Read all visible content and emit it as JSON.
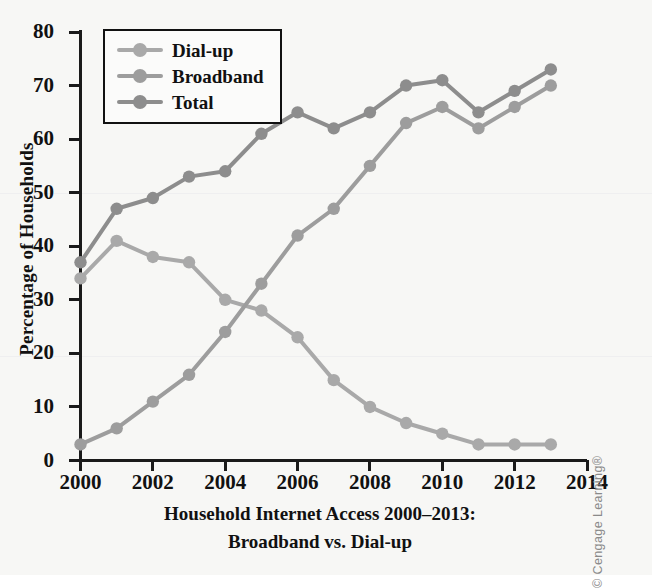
{
  "figure": {
    "background_color": "#f7f7f5",
    "caption_line1": "Household Internet Access 2000–2013:",
    "caption_line2": "Broadband vs. Dial-up",
    "credit": "© Cengage Learning®"
  },
  "legend": {
    "position": "top-left-inside",
    "entries": [
      {
        "label": "Dial-up",
        "color": "#a9a9a9"
      },
      {
        "label": "Broadband",
        "color": "#9d9d9d"
      },
      {
        "label": "Total",
        "color": "#8d8d8d"
      }
    ]
  },
  "axes": {
    "y_title": "Percentage of Households",
    "y_ticks": [
      "0",
      "10",
      "20",
      "30",
      "40",
      "50",
      "60",
      "70",
      "80"
    ],
    "x_ticks": [
      "2000",
      "2002",
      "2004",
      "2006",
      "2008",
      "2010",
      "2012",
      "2014"
    ]
  },
  "chart_data": {
    "type": "line",
    "title": "Household Internet Access 2000–2013: Broadband vs. Dial-up",
    "xlabel": "",
    "ylabel": "Percentage of Households",
    "xlim": [
      2000,
      2014
    ],
    "ylim": [
      0,
      80
    ],
    "ytick_step": 10,
    "xtick_step": 2,
    "grid": false,
    "legend_position": "upper left",
    "x": [
      2000,
      2001,
      2002,
      2003,
      2004,
      2005,
      2006,
      2007,
      2008,
      2009,
      2010,
      2011,
      2012,
      2013
    ],
    "series": [
      {
        "name": "Dial-up",
        "color": "#a9a9a9",
        "values": [
          34,
          41,
          38,
          37,
          30,
          28,
          23,
          15,
          10,
          7,
          5,
          3,
          3,
          3
        ]
      },
      {
        "name": "Broadband",
        "color": "#9d9d9d",
        "values": [
          3,
          6,
          11,
          16,
          24,
          33,
          42,
          47,
          55,
          63,
          66,
          62,
          66,
          70
        ]
      },
      {
        "name": "Total",
        "color": "#8d8d8d",
        "values": [
          37,
          47,
          49,
          53,
          54,
          61,
          65,
          62,
          65,
          70,
          71,
          65,
          69,
          73
        ]
      }
    ]
  }
}
